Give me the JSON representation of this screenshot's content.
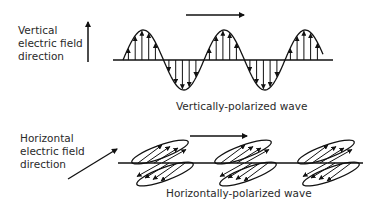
{
  "vertical": {
    "label": "Vertical\nelectric field\ndirection",
    "caption": "Vertically-polarized wave"
  },
  "horizontal": {
    "label": "Horizontal\nelectric field\ndirection",
    "caption": "Horizontally-polarized wave"
  }
}
